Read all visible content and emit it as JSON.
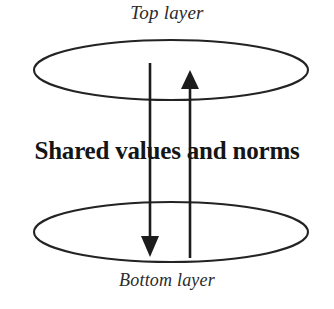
{
  "figure": {
    "type": "layered-ellipse-diagram",
    "background_color": "#ffffff",
    "stroke_color": "#232323",
    "text_color": "#1a1a1a",
    "top_label": "Top layer",
    "bottom_label": "Bottom layer",
    "center_text": "Shared values and norms",
    "shapes": {
      "top_ellipse": {
        "cx": 171,
        "cy": 70,
        "rx": 137,
        "ry": 30
      },
      "bottom_ellipse": {
        "cx": 171,
        "cy": 232,
        "rx": 137,
        "ry": 30
      }
    },
    "arrows": [
      {
        "name": "downward-arrow",
        "direction": "down",
        "from": "top layer",
        "to": "bottom layer",
        "x": 150,
        "y_start": 63,
        "y_end": 253
      },
      {
        "name": "upward-arrow",
        "direction": "up",
        "from": "bottom layer",
        "to": "top layer",
        "x": 190,
        "y_start": 258,
        "y_end": 72
      }
    ]
  }
}
